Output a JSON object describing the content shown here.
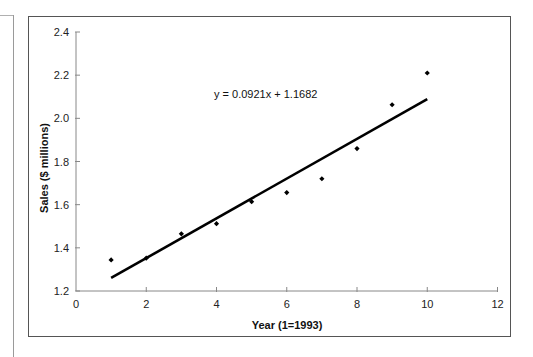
{
  "chart_data": {
    "type": "scatter",
    "title": "",
    "xlabel": "Year (1=1993)",
    "ylabel": "Sales ($ millions)",
    "xlim": [
      0,
      12
    ],
    "ylim": [
      1.2,
      2.4
    ],
    "x_ticks": [
      0,
      2,
      4,
      6,
      8,
      10,
      12
    ],
    "y_ticks": [
      "1.2",
      "1.4",
      "1.6",
      "1.8",
      "2.0",
      "2.2",
      "2.4"
    ],
    "grid": false,
    "series": [
      {
        "name": "Sales",
        "x": [
          1,
          2,
          3,
          4,
          5,
          6,
          7,
          8,
          9,
          10
        ],
        "y": [
          1.344,
          1.352,
          1.465,
          1.512,
          1.614,
          1.656,
          1.72,
          1.86,
          2.063,
          2.21
        ]
      }
    ],
    "trendline": {
      "type": "linear",
      "slope": 0.0921,
      "intercept": 1.1682,
      "x_range": [
        1,
        10
      ],
      "equation_label": "y = 0.0921x + 1.1682"
    }
  }
}
